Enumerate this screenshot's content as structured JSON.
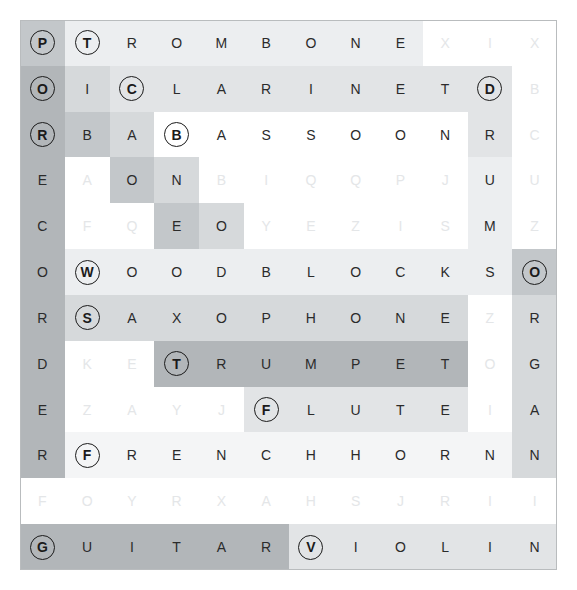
{
  "puzzle": {
    "type": "word-search",
    "rows": 12,
    "cols": 12,
    "background_color": "#ffffff",
    "border_color": "#b9bcbe",
    "letter_color": "#2b2b2b",
    "faint_letter_color": "#eceef0",
    "highlight_colors": [
      "#ffffff",
      "#f4f5f6",
      "#eceef0",
      "#e2e4e6",
      "#d6d9db",
      "#c3c7ca",
      "#b2b6b9",
      "#a7abae"
    ],
    "grid": [
      [
        "P",
        "T",
        "R",
        "O",
        "M",
        "B",
        "O",
        "N",
        "E",
        "X",
        "I",
        "X"
      ],
      [
        "O",
        "I",
        "C",
        "L",
        "A",
        "R",
        "I",
        "N",
        "E",
        "T",
        "D",
        "B"
      ],
      [
        "R",
        "B",
        "A",
        "B",
        "A",
        "S",
        "S",
        "O",
        "O",
        "N",
        "R",
        "C"
      ],
      [
        "E",
        "A",
        "O",
        "N",
        "B",
        "I",
        "Q",
        "Q",
        "P",
        "J",
        "U",
        "U"
      ],
      [
        "C",
        "F",
        "Q",
        "E",
        "O",
        "Y",
        "E",
        "Z",
        "I",
        "S",
        "M",
        "Z"
      ],
      [
        "O",
        "W",
        "O",
        "O",
        "D",
        "B",
        "L",
        "O",
        "C",
        "K",
        "S",
        "O"
      ],
      [
        "R",
        "S",
        "A",
        "X",
        "O",
        "P",
        "H",
        "O",
        "N",
        "E",
        "Z",
        "R"
      ],
      [
        "D",
        "K",
        "E",
        "T",
        "R",
        "U",
        "M",
        "P",
        "E",
        "T",
        "O",
        "G"
      ],
      [
        "E",
        "Z",
        "A",
        "Y",
        "J",
        "F",
        "L",
        "U",
        "T",
        "E",
        "I",
        "A"
      ],
      [
        "R",
        "F",
        "R",
        "E",
        "N",
        "C",
        "H",
        "H",
        "O",
        "R",
        "N",
        "N"
      ],
      [
        "F",
        "O",
        "Y",
        "R",
        "X",
        "A",
        "H",
        "S",
        "J",
        "R",
        "I",
        "I"
      ],
      [
        "G",
        "U",
        "I",
        "T",
        "A",
        "R",
        "V",
        "I",
        "O",
        "L",
        "I",
        "N"
      ]
    ],
    "highlight": [
      [
        5,
        2,
        2,
        2,
        2,
        2,
        2,
        2,
        2,
        0,
        0,
        0
      ],
      [
        6,
        4,
        3,
        3,
        3,
        3,
        3,
        3,
        3,
        3,
        3,
        0
      ],
      [
        6,
        5,
        4,
        0,
        0,
        0,
        0,
        0,
        0,
        0,
        3,
        0
      ],
      [
        6,
        0,
        5,
        4,
        0,
        0,
        0,
        0,
        0,
        0,
        2,
        0
      ],
      [
        6,
        0,
        0,
        5,
        4,
        0,
        0,
        0,
        0,
        0,
        2,
        0
      ],
      [
        6,
        2,
        2,
        2,
        2,
        2,
        2,
        2,
        2,
        2,
        2,
        5
      ],
      [
        6,
        4,
        4,
        4,
        4,
        4,
        4,
        4,
        4,
        4,
        0,
        4
      ],
      [
        6,
        0,
        0,
        6,
        6,
        6,
        6,
        6,
        6,
        6,
        0,
        4
      ],
      [
        6,
        0,
        0,
        0,
        0,
        3,
        3,
        3,
        3,
        3,
        0,
        4
      ],
      [
        6,
        1,
        1,
        1,
        1,
        1,
        1,
        1,
        1,
        1,
        1,
        4
      ],
      [
        0,
        0,
        0,
        0,
        0,
        0,
        0,
        0,
        0,
        0,
        0,
        0
      ],
      [
        6,
        6,
        6,
        6,
        6,
        6,
        3,
        3,
        3,
        3,
        3,
        3
      ]
    ],
    "faint": [
      [
        0,
        0,
        0,
        0,
        0,
        0,
        0,
        0,
        0,
        1,
        1,
        1
      ],
      [
        0,
        0,
        0,
        0,
        0,
        0,
        0,
        0,
        0,
        0,
        0,
        1
      ],
      [
        0,
        0,
        0,
        0,
        0,
        0,
        0,
        0,
        0,
        0,
        0,
        1
      ],
      [
        0,
        1,
        0,
        0,
        1,
        1,
        1,
        1,
        1,
        1,
        0,
        1
      ],
      [
        0,
        1,
        1,
        0,
        0,
        1,
        1,
        1,
        1,
        1,
        0,
        1
      ],
      [
        0,
        0,
        0,
        0,
        0,
        0,
        0,
        0,
        0,
        0,
        0,
        0
      ],
      [
        0,
        0,
        0,
        0,
        0,
        0,
        0,
        0,
        0,
        0,
        1,
        0
      ],
      [
        0,
        1,
        1,
        0,
        0,
        0,
        0,
        0,
        0,
        0,
        1,
        0
      ],
      [
        0,
        1,
        1,
        1,
        1,
        0,
        0,
        0,
        0,
        0,
        1,
        0
      ],
      [
        0,
        0,
        0,
        0,
        0,
        0,
        0,
        0,
        0,
        0,
        0,
        0
      ],
      [
        1,
        1,
        1,
        1,
        1,
        1,
        1,
        1,
        1,
        1,
        1,
        1
      ],
      [
        0,
        0,
        0,
        0,
        0,
        0,
        0,
        0,
        0,
        0,
        0,
        0
      ]
    ],
    "circled": [
      [
        1,
        1,
        0,
        0,
        0,
        0,
        0,
        0,
        0,
        0,
        0,
        0
      ],
      [
        1,
        0,
        1,
        0,
        0,
        0,
        0,
        0,
        0,
        0,
        1,
        0
      ],
      [
        1,
        0,
        0,
        1,
        0,
        0,
        0,
        0,
        0,
        0,
        0,
        0
      ],
      [
        0,
        0,
        0,
        0,
        0,
        0,
        0,
        0,
        0,
        0,
        0,
        0
      ],
      [
        0,
        0,
        0,
        0,
        0,
        0,
        0,
        0,
        0,
        0,
        0,
        0
      ],
      [
        0,
        1,
        0,
        0,
        0,
        0,
        0,
        0,
        0,
        0,
        0,
        1
      ],
      [
        0,
        1,
        0,
        0,
        0,
        0,
        0,
        0,
        0,
        0,
        0,
        0
      ],
      [
        0,
        0,
        0,
        1,
        0,
        0,
        0,
        0,
        0,
        0,
        0,
        0
      ],
      [
        0,
        0,
        0,
        0,
        0,
        1,
        0,
        0,
        0,
        0,
        0,
        0
      ],
      [
        0,
        1,
        0,
        0,
        0,
        0,
        0,
        0,
        0,
        0,
        0,
        0
      ],
      [
        0,
        0,
        0,
        0,
        0,
        0,
        0,
        0,
        0,
        0,
        0,
        0
      ],
      [
        1,
        0,
        0,
        0,
        0,
        0,
        1,
        0,
        0,
        0,
        0,
        0
      ]
    ],
    "found_words": [
      {
        "word": "TROMBONE",
        "start": [
          0,
          1
        ],
        "direction": "across",
        "circle_letter": "T"
      },
      {
        "word": "PICCOLO",
        "start": [
          0,
          0
        ],
        "direction": "diagonal-down-right",
        "circle_letter": "P"
      },
      {
        "word": "CLARINET",
        "start": [
          1,
          2
        ],
        "direction": "across",
        "circle_letter": "C"
      },
      {
        "word": "OBOE",
        "start": [
          1,
          0
        ],
        "direction": "diagonal-down-right",
        "circle_letter": "O"
      },
      {
        "word": "BASSOON",
        "start": [
          2,
          3
        ],
        "direction": "across",
        "circle_letter": "B"
      },
      {
        "word": "RECORDER",
        "start": [
          2,
          0
        ],
        "direction": "down",
        "circle_letter": "R"
      },
      {
        "word": "DRUMS",
        "start": [
          1,
          10
        ],
        "direction": "down",
        "circle_letter": "D"
      },
      {
        "word": "WOODBLOCKS",
        "start": [
          5,
          1
        ],
        "direction": "across",
        "circle_letter": "W"
      },
      {
        "word": "ORGAN",
        "start": [
          5,
          11
        ],
        "direction": "down",
        "circle_letter": "O"
      },
      {
        "word": "SAXOPHONE",
        "start": [
          6,
          1
        ],
        "direction": "across",
        "circle_letter": "S"
      },
      {
        "word": "TRUMPET",
        "start": [
          7,
          3
        ],
        "direction": "across",
        "circle_letter": "T"
      },
      {
        "word": "FLUTE",
        "start": [
          8,
          5
        ],
        "direction": "across",
        "circle_letter": "F"
      },
      {
        "word": "FRENCHHORN",
        "start": [
          9,
          1
        ],
        "direction": "across",
        "circle_letter": "F"
      },
      {
        "word": "GUITAR",
        "start": [
          11,
          0
        ],
        "direction": "across",
        "circle_letter": "G"
      },
      {
        "word": "VIOLIN",
        "start": [
          11,
          6
        ],
        "direction": "across",
        "circle_letter": "V"
      }
    ]
  }
}
